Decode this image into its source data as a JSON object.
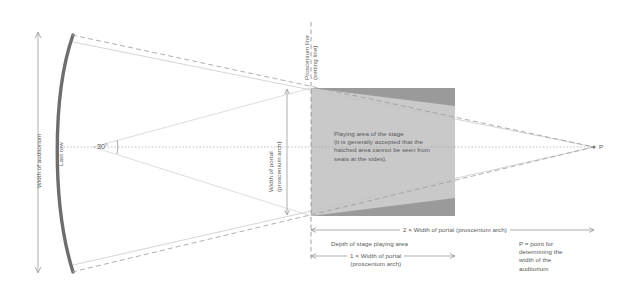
{
  "diagram": {
    "colors": {
      "stage_rect_fill": "#9a9a9a",
      "playing_area_fill": "#c9c9c9",
      "arc_stroke": "#6e6e70",
      "line_stroke": "#b4b4b6",
      "dash_stroke": "#9b9b9d",
      "text": "#58585a",
      "dim_stroke": "#8a8a8c"
    },
    "labels": {
      "width_of_auditorium": "Width of auditorium",
      "last_row": "Last row",
      "angle": "30°",
      "proscenium_line": "Proscenium line\n(setting line)",
      "width_of_portal": "Width of portal\n(proscenium arch)",
      "playing_area": "Playing area of the stage\n(it is generally accepted that the\nhatched area cannot be seen from\nseats at the sides).",
      "two_width_portal": "2 × Width of portal (proscenium arch)",
      "depth_of_stage": "Depth of stage playing area",
      "one_width_portal": "1 × Width of portal\n(proscenium arch)",
      "point_p": "P",
      "point_p_definition": "P = point for\ndetermining the\nwidth of the\nauditorium"
    }
  }
}
